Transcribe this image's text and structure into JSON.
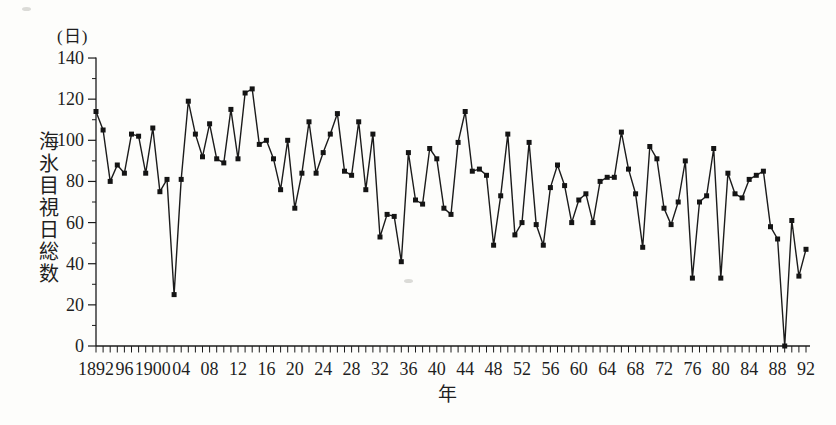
{
  "page": {
    "background": "#fdfdfb"
  },
  "chart_data": {
    "type": "line",
    "title": "",
    "y_unit": "(日)",
    "ylabel": "海氷目視日総数",
    "xlabel": "年",
    "x_start": 1892,
    "x_end": 1992,
    "values": [
      114,
      105,
      80,
      88,
      84,
      103,
      102,
      84,
      106,
      75,
      81,
      25,
      81,
      119,
      103,
      92,
      108,
      91,
      89,
      115,
      91,
      123,
      125,
      98,
      100,
      91,
      76,
      100,
      67,
      84,
      109,
      84,
      94,
      103,
      113,
      85,
      83,
      109,
      76,
      103,
      53,
      64,
      63,
      41,
      94,
      71,
      69,
      96,
      91,
      67,
      64,
      99,
      114,
      85,
      86,
      83,
      49,
      73,
      103,
      54,
      60,
      99,
      59,
      49,
      77,
      88,
      78,
      60,
      71,
      74,
      60,
      80,
      82,
      82,
      104,
      86,
      74,
      48,
      97,
      91,
      67,
      59,
      70,
      90,
      33,
      70,
      73,
      96,
      33,
      84,
      74,
      72,
      81,
      83,
      85,
      58,
      52,
      0,
      61,
      34,
      47
    ],
    "ylim": [
      0,
      140
    ],
    "y_major_step": 20,
    "y_minor_step": 10,
    "y_tick_labels": [
      "0",
      "20",
      "40",
      "60",
      "80",
      "100",
      "120",
      "140"
    ],
    "x_label_years": [
      1892,
      1896,
      1900,
      1904,
      1908,
      1912,
      1916,
      1920,
      1924,
      1928,
      1932,
      1936,
      1940,
      1944,
      1948,
      1952,
      1956,
      1960,
      1964,
      1968,
      1972,
      1976,
      1980,
      1984,
      1988,
      1992
    ],
    "x_tick_labels": [
      "1892",
      "96",
      "1900",
      "04",
      "08",
      "12",
      "16",
      "20",
      "24",
      "28",
      "32",
      "36",
      "40",
      "44",
      "48",
      "52",
      "56",
      "60",
      "64",
      "68",
      "72",
      "76",
      "80",
      "84",
      "88",
      "92"
    ],
    "marker": "filled-square",
    "marker_size": 5,
    "line_color": "#1b1b1b",
    "text_color": "#1f1f1f",
    "grid": false,
    "legend": "none"
  },
  "artifacts": [
    {
      "x": 22,
      "y": 7
    },
    {
      "x": 404,
      "y": 279
    }
  ]
}
